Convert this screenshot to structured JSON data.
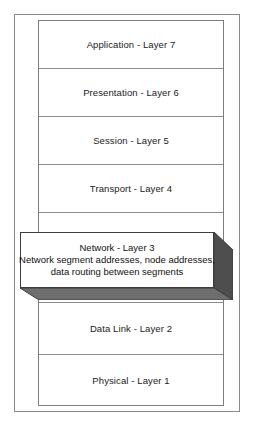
{
  "diagram": {
    "type": "osi-layer-stack",
    "title": "",
    "layers": [
      {
        "id": "layer-7",
        "label": "Application - Layer 7",
        "number": 7,
        "name": "Application",
        "highlighted": false
      },
      {
        "id": "layer-6",
        "label": "Presentation - Layer 6",
        "number": 6,
        "name": "Presentation",
        "highlighted": false
      },
      {
        "id": "layer-5",
        "label": "Session - Layer 5",
        "number": 5,
        "name": "Session",
        "highlighted": false
      },
      {
        "id": "layer-4",
        "label": "Transport - Layer 4",
        "number": 4,
        "name": "Transport",
        "highlighted": false
      },
      {
        "id": "layer-3",
        "label": "Network - Layer 3",
        "number": 3,
        "name": "Network",
        "highlighted": true
      },
      {
        "id": "layer-2",
        "label": "Data Link - Layer 2",
        "number": 2,
        "name": "Data Link",
        "highlighted": false
      },
      {
        "id": "layer-1",
        "label": "Physical - Layer 1",
        "number": 1,
        "name": "Physical",
        "highlighted": false
      }
    ],
    "callout": {
      "title": "Network - Layer 3",
      "description_line_1": "Network segment addresses, node addresses,",
      "description_line_2": "data routing between segments"
    },
    "colors": {
      "background": "#ffffff",
      "frame_border": "#8a8a8a",
      "stack_border": "#7d7d7d",
      "row_divider": "#8c8c8c",
      "text": "#1b1b1b",
      "callout_face": "#ffffff",
      "callout_border": "#3d3d3d",
      "callout_side_shadow": "#4e4e4e",
      "callout_bottom_shadow": "#6e6e6e"
    }
  }
}
